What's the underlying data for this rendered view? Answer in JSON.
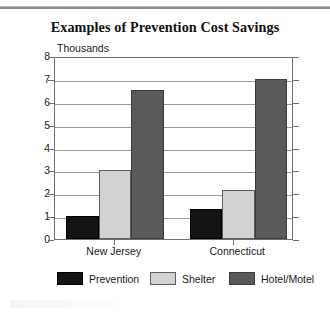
{
  "chart_data": {
    "type": "bar",
    "title": "Examples of Prevention Cost Savings",
    "subtitle": "",
    "xlabel": "",
    "ylabel": "Thousands",
    "categories": [
      "New Jersey",
      "Connecticut"
    ],
    "series": [
      {
        "name": "Prevention",
        "color": "#141414",
        "values": [
          1.0,
          1.3
        ]
      },
      {
        "name": "Shelter",
        "color": "#d2d2d2",
        "values": [
          3.0,
          2.15
        ]
      },
      {
        "name": "Hotel/Motel",
        "color": "#5a5a5a",
        "values": [
          6.5,
          7.0
        ]
      }
    ],
    "ylim": [
      0,
      8
    ],
    "yticks": [
      "0",
      "1",
      "2",
      "3",
      "4",
      "5",
      "6",
      "7",
      "8"
    ],
    "grid": true,
    "legend_position": "bottom"
  },
  "legend": {
    "items": [
      {
        "label": "Prevention"
      },
      {
        "label": "Shelter"
      },
      {
        "label": "Hotel/Motel"
      }
    ]
  },
  "axis": {
    "unit_label": "Thousands"
  }
}
